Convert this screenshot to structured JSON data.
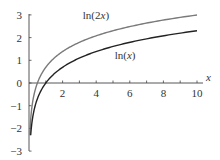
{
  "chart_data": {
    "type": "line",
    "title": "",
    "xlabel": "x",
    "ylabel": "",
    "xlim": [
      0,
      10
    ],
    "ylim": [
      -3,
      3
    ],
    "grid": false,
    "legend": "inline labels",
    "x_ticks": [
      2,
      4,
      6,
      8,
      10
    ],
    "x_tick_labels": [
      "2",
      "4",
      "6",
      "8",
      "10"
    ],
    "y_ticks": [
      -3,
      -2,
      -1,
      0,
      1,
      2,
      3
    ],
    "y_tick_labels": [
      "−3",
      "−2",
      "−1",
      "0",
      "1",
      "2",
      "3"
    ],
    "series": [
      {
        "name": "ln(2x)",
        "label": "ln(2x)",
        "color": "#7a7a7a",
        "x": [
          0.05,
          0.1,
          0.2,
          0.3,
          0.5,
          0.75,
          1,
          1.5,
          2,
          3,
          4,
          5,
          6,
          7,
          8,
          9,
          10
        ],
        "values": [
          -2.3,
          -1.61,
          -0.92,
          -0.51,
          0.0,
          0.41,
          0.69,
          1.1,
          1.39,
          1.79,
          2.08,
          2.3,
          2.48,
          2.64,
          2.77,
          2.89,
          3.0
        ]
      },
      {
        "name": "ln(x)",
        "label": "ln(x)",
        "color": "#222222",
        "x": [
          0.1,
          0.15,
          0.2,
          0.3,
          0.5,
          0.75,
          1,
          1.5,
          2,
          3,
          4,
          5,
          6,
          7,
          8,
          9,
          10
        ],
        "values": [
          -2.3,
          -1.9,
          -1.61,
          -1.2,
          -0.69,
          -0.29,
          0.0,
          0.41,
          0.69,
          1.1,
          1.39,
          1.61,
          1.79,
          1.95,
          2.08,
          2.2,
          2.3
        ]
      }
    ],
    "annotations": [
      {
        "text": "ln(2x)",
        "x": 3.2,
        "y": 2.8
      },
      {
        "text": "ln(x)",
        "x": 5.1,
        "y": 1.05
      }
    ]
  }
}
